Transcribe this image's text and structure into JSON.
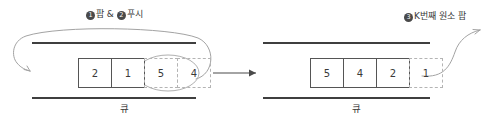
{
  "diagram": {
    "title_visible": false,
    "colors": {
      "line": "#3f3f3f",
      "box_border": "#555555",
      "dashed_border": "#b4b4b4",
      "arrow": "#9a9a9a",
      "bullet_fill": "#4a4a4a",
      "text": "#3a3a3a",
      "background": "#ffffff"
    },
    "left_panel": {
      "step_label": {
        "bullet_one": "1",
        "text_one": "팝 &",
        "bullet_two": "2",
        "text_two": "푸시",
        "full_text": "❶ 팝 & ❷ 푸시"
      },
      "cells": [
        {
          "value": "2",
          "style": "solid"
        },
        {
          "value": "1",
          "style": "solid"
        },
        {
          "value": "5",
          "style": "dashed"
        },
        {
          "value": "4",
          "style": "dashed"
        }
      ],
      "highlight_shape": "ellipse",
      "highlight_cells": [
        "5",
        "4"
      ],
      "caption": "큐"
    },
    "transition_arrow": "→",
    "right_panel": {
      "step_label": {
        "bullet_three": "3",
        "text_three": "K번째 원소 팝",
        "full_text": "❸ K번째 원소 팝"
      },
      "cells": [
        {
          "value": "5",
          "style": "solid"
        },
        {
          "value": "4",
          "style": "solid"
        },
        {
          "value": "2",
          "style": "solid"
        },
        {
          "value": "1",
          "style": "dashed"
        }
      ],
      "caption": "큐"
    }
  }
}
